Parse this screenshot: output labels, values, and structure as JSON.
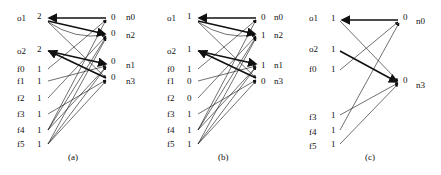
{
  "panels": [
    {
      "caption": "(a)",
      "left_nodes": [
        {
          "name": "o1",
          "value": "2",
          "y": 19
        },
        {
          "name": "o2",
          "value": "2",
          "y": 50
        },
        {
          "name": "f0",
          "value": "1",
          "y": 69
        },
        {
          "name": "f1",
          "value": "1",
          "y": 81
        },
        {
          "name": "f2",
          "value": "1",
          "y": 98
        },
        {
          "name": "f3",
          "value": "1",
          "y": 114
        },
        {
          "name": "f4",
          "value": "1",
          "y": 130
        },
        {
          "name": "f5",
          "value": "1",
          "y": 144
        }
      ],
      "right_nodes": [
        {
          "name": "n0",
          "value": "0",
          "y": 18
        },
        {
          "name": "n2",
          "value": "0",
          "y": 34
        },
        {
          "name": "n1",
          "value": "0",
          "y": 64
        },
        {
          "name": "n3",
          "value": "0",
          "y": 79
        }
      ]
    },
    {
      "caption": "(b)",
      "left_nodes": [
        {
          "name": "o1",
          "value": "1",
          "y": 19
        },
        {
          "name": "o2",
          "value": "1",
          "y": 50
        },
        {
          "name": "f0",
          "value": "1",
          "y": 69
        },
        {
          "name": "f1",
          "value": "0",
          "y": 81
        },
        {
          "name": "f2",
          "value": "0",
          "y": 98
        },
        {
          "name": "f3",
          "value": "1",
          "y": 114
        },
        {
          "name": "f4",
          "value": "1",
          "y": 130
        },
        {
          "name": "f5",
          "value": "1",
          "y": 144
        }
      ],
      "right_nodes": [
        {
          "name": "n0",
          "value": "0",
          "y": 18
        },
        {
          "name": "n2",
          "value": "1",
          "y": 34
        },
        {
          "name": "n1",
          "value": "1",
          "y": 64
        },
        {
          "name": "n3",
          "value": "0",
          "y": 79
        }
      ]
    },
    {
      "caption": "(c)",
      "left_nodes": [
        {
          "name": "o1",
          "value": "1",
          "y": 19
        },
        {
          "name": "o2",
          "value": "1",
          "y": 50
        },
        {
          "name": "f0",
          "value": "1",
          "y": 69
        },
        {
          "name": "f3",
          "value": "1",
          "y": 114
        },
        {
          "name": "f4",
          "value": "1",
          "y": 130
        },
        {
          "name": "f5",
          "value": "1",
          "y": 144
        }
      ],
      "right_nodes": [
        {
          "name": "n0",
          "value": "0",
          "y": 18
        },
        {
          "name": "n3",
          "value": "0",
          "y": 79
        }
      ]
    }
  ]
}
